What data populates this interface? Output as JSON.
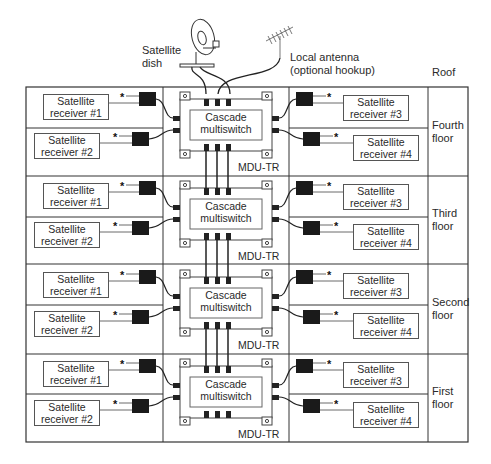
{
  "top": {
    "dish_label_line1": "Satellite",
    "dish_label_line2": "dish",
    "antenna_label_line1": "Local antenna",
    "antenna_label_line2": "(optional hookup)",
    "roof_label": "Roof"
  },
  "floors": [
    {
      "name_line1": "Fourth",
      "name_line2": "floor",
      "switch_line1": "Cascade",
      "switch_line2": "multiswitch",
      "model": "MDU-TR",
      "receivers": [
        {
          "line1": "Satellite",
          "line2": "receiver #1"
        },
        {
          "line1": "Satellite",
          "line2": "receiver #2"
        },
        {
          "line1": "Satellite",
          "line2": "receiver #3"
        },
        {
          "line1": "Satellite",
          "line2": "receiver #4"
        }
      ]
    },
    {
      "name_line1": "Third",
      "name_line2": "floor",
      "switch_line1": "Cascade",
      "switch_line2": "multiswitch",
      "model": "MDU-TR",
      "receivers": [
        {
          "line1": "Satellite",
          "line2": "receiver #1"
        },
        {
          "line1": "Satellite",
          "line2": "receiver #2"
        },
        {
          "line1": "Satellite",
          "line2": "receiver #3"
        },
        {
          "line1": "Satellite",
          "line2": "receiver #4"
        }
      ]
    },
    {
      "name_line1": "Second",
      "name_line2": "floor",
      "switch_line1": "Cascade",
      "switch_line2": "multiswitch",
      "model": "MDU-TR",
      "receivers": [
        {
          "line1": "Satellite",
          "line2": "receiver #1"
        },
        {
          "line1": "Satellite",
          "line2": "receiver #2"
        },
        {
          "line1": "Satellite",
          "line2": "receiver #3"
        },
        {
          "line1": "Satellite",
          "line2": "receiver #4"
        }
      ]
    },
    {
      "name_line1": "First",
      "name_line2": "floor",
      "switch_line1": "Cascade",
      "switch_line2": "multiswitch",
      "model": "MDU-TR",
      "receivers": [
        {
          "line1": "Satellite",
          "line2": "receiver #1"
        },
        {
          "line1": "Satellite",
          "line2": "receiver #2"
        },
        {
          "line1": "Satellite",
          "line2": "receiver #3"
        },
        {
          "line1": "Satellite",
          "line2": "receiver #4"
        }
      ]
    }
  ],
  "star_symbol": "*"
}
